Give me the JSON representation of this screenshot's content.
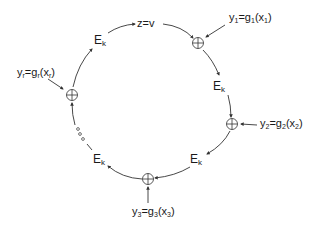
{
  "diagram": {
    "type": "ring-feedback",
    "center_label": "z=v",
    "nodes": [
      {
        "id": "xor1",
        "kind": "xor",
        "symbol": "⊕"
      },
      {
        "id": "ek1",
        "kind": "function",
        "main": "E",
        "sub": "k"
      },
      {
        "id": "xor2",
        "kind": "xor",
        "symbol": "⊕"
      },
      {
        "id": "ek2",
        "kind": "function",
        "main": "E",
        "sub": "k"
      },
      {
        "id": "xor3",
        "kind": "xor",
        "symbol": "⊕"
      },
      {
        "id": "ek3",
        "kind": "function",
        "main": "E",
        "sub": "k"
      },
      {
        "id": "ellipsis",
        "kind": "ellipsis",
        "symbol": "◦◦◦"
      },
      {
        "id": "xorr",
        "kind": "xor",
        "symbol": "⊕"
      },
      {
        "id": "ekr",
        "kind": "function",
        "main": "E",
        "sub": "k"
      }
    ],
    "inputs": [
      {
        "target": "xor1",
        "y": "y",
        "y_sub": "1",
        "eq": "=",
        "g": "g",
        "g_sub": "1",
        "x": "x",
        "x_sub": "1"
      },
      {
        "target": "xor2",
        "y": "y",
        "y_sub": "2",
        "eq": "=",
        "g": "g",
        "g_sub": "2",
        "x": "x",
        "x_sub": "2"
      },
      {
        "target": "xor3",
        "y": "y",
        "y_sub": "3",
        "eq": "=",
        "g": "g",
        "g_sub": "3",
        "x": "x",
        "x_sub": "3"
      },
      {
        "target": "xorr",
        "y": "y",
        "y_sub": "r",
        "eq": "=",
        "g": "g",
        "g_sub": "r",
        "x": "x",
        "x_sub": "r"
      }
    ],
    "colors": {
      "line": "#333333",
      "text": "#1a1a1a",
      "background": "#ffffff"
    }
  }
}
